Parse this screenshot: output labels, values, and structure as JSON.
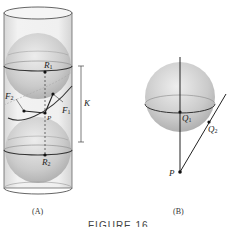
{
  "figure": {
    "title": "FIGURE 16",
    "panels": [
      {
        "caption": "(A)",
        "labels": {
          "R1": {
            "main": "R",
            "sub": "1"
          },
          "R2": {
            "main": "R",
            "sub": "2"
          },
          "F1": {
            "main": "F",
            "sub": "1"
          },
          "F2": {
            "main": "F",
            "sub": "2"
          },
          "P": {
            "main": "P",
            "sub": ""
          },
          "K": {
            "main": "K",
            "sub": ""
          }
        }
      },
      {
        "caption": "(B)",
        "labels": {
          "Q1": {
            "main": "Q",
            "sub": "1"
          },
          "Q2": {
            "main": "Q",
            "sub": "2"
          },
          "P": {
            "main": "P",
            "sub": ""
          }
        }
      }
    ],
    "colors": {
      "sphere_fill": "#c8c8c8",
      "cylinder_stroke": "#555555",
      "line": "#222222",
      "background": "#ffffff"
    }
  }
}
